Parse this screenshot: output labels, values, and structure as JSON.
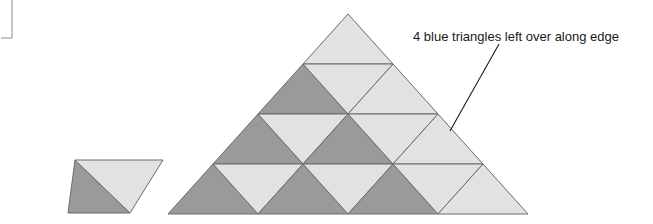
{
  "figure": {
    "background_color": "#ffffff",
    "colors": {
      "blue_fill": "#9a9a9a",
      "light_fill": "#e2e2e2",
      "light_fill_alt": "#ededed",
      "outline": "#6b6b6b",
      "leader_line": "#1a1a1a",
      "text": "#1a1a1a",
      "crop_mark": "#8c8c8c"
    },
    "annotation": {
      "label": "4 blue triangles left over along edge",
      "leader_from": {
        "x": 450,
        "y": 131
      },
      "leader_to": {
        "x": 499,
        "y": 44
      },
      "text_anchor": {
        "x": 413,
        "y": 41
      }
    },
    "crop_mark": {
      "name": "crop-mark-bracket",
      "x": 12,
      "y_top": 0,
      "y_bottom": 38
    },
    "unit_parallelogram": {
      "name": "unit-parallelogram",
      "description": "One dark blue up-triangle joined to one light down-triangle forming a rhombus",
      "vertices": [
        {
          "x": 68,
          "y": 213
        },
        {
          "x": 75,
          "y": 160
        },
        {
          "x": 163,
          "y": 160
        },
        {
          "x": 156,
          "y": 213
        }
      ],
      "pieces": [
        {
          "name": "unit-blue-triangle",
          "shade": "blue",
          "points": "68,213 75,160 130,213"
        },
        {
          "name": "unit-light-triangle",
          "shade": "light",
          "points": "75,160 163,160 130,213"
        }
      ]
    },
    "big_triangle": {
      "name": "large-triangle-assembly",
      "apex": {
        "x": 348,
        "y": 14
      },
      "bottom_left": {
        "x": 166,
        "y": 213
      },
      "bottom_right": {
        "x": 530,
        "y": 213
      },
      "rows": 4,
      "row_height": 50,
      "half_width": 45,
      "cells": [
        {
          "name": "cell-r1-c1",
          "shade": "light",
          "dir": "up",
          "points": "348,14 303,64 393,64"
        },
        {
          "name": "cell-r2-c1",
          "shade": "blue",
          "dir": "up",
          "points": "303,64 258,114 348,114"
        },
        {
          "name": "cell-r2-c2",
          "shade": "light",
          "dir": "down",
          "points": "303,64 393,64 348,114"
        },
        {
          "name": "cell-r2-c3",
          "shade": "light",
          "dir": "up",
          "points": "393,64 348,114 438,114"
        },
        {
          "name": "cell-r3-c1",
          "shade": "blue",
          "dir": "up",
          "points": "258,114 213,164 303,164"
        },
        {
          "name": "cell-r3-c2",
          "shade": "light",
          "dir": "down",
          "points": "258,114 348,114 303,164"
        },
        {
          "name": "cell-r3-c3",
          "shade": "blue",
          "dir": "up",
          "points": "348,114 303,164 393,164"
        },
        {
          "name": "cell-r3-c4",
          "shade": "light",
          "dir": "down",
          "points": "348,114 438,114 393,164"
        },
        {
          "name": "cell-r3-c5",
          "shade": "light",
          "dir": "up",
          "points": "438,114 393,164 483,164"
        },
        {
          "name": "cell-r4-c1",
          "shade": "blue",
          "dir": "up",
          "points": "213,164 168,214 258,214"
        },
        {
          "name": "cell-r4-c2",
          "shade": "light",
          "dir": "down",
          "points": "213,164 303,164 258,214"
        },
        {
          "name": "cell-r4-c3",
          "shade": "blue",
          "dir": "up",
          "points": "303,164 258,214 348,214"
        },
        {
          "name": "cell-r4-c4",
          "shade": "light",
          "dir": "down",
          "points": "303,164 393,164 348,214"
        },
        {
          "name": "cell-r4-c5",
          "shade": "blue",
          "dir": "up",
          "points": "393,164 348,214 438,214"
        },
        {
          "name": "cell-r4-c6",
          "shade": "light",
          "dir": "down",
          "points": "393,164 483,164 438,214"
        },
        {
          "name": "cell-r4-c7",
          "shade": "light",
          "dir": "up",
          "points": "483,164 438,214 528,214"
        }
      ],
      "leftover_count": 4
    }
  }
}
